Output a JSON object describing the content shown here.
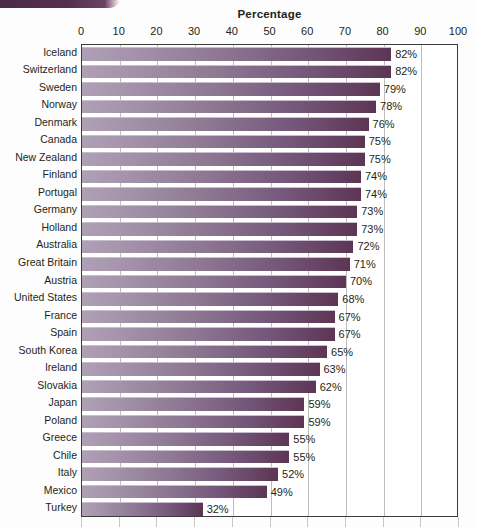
{
  "chart_data": {
    "type": "bar",
    "orientation": "horizontal",
    "title": "Percentage",
    "xlabel": "",
    "ylabel": "",
    "xlim": [
      0,
      100
    ],
    "xticks": [
      0,
      10,
      20,
      30,
      40,
      50,
      60,
      70,
      80,
      90,
      100
    ],
    "grid": true,
    "legend": "none",
    "value_suffix": "%",
    "categories": [
      "Iceland",
      "Switzerland",
      "Sweden",
      "Norway",
      "Denmark",
      "Canada",
      "New Zealand",
      "Finland",
      "Portugal",
      "Germany",
      "Holland",
      "Australia",
      "Great Britain",
      "Austria",
      "United States",
      "France",
      "Spain",
      "South Korea",
      "Ireland",
      "Slovakia",
      "Japan",
      "Poland",
      "Greece",
      "Chile",
      "Italy",
      "Mexico",
      "Turkey"
    ],
    "values": [
      82,
      82,
      79,
      78,
      76,
      75,
      75,
      74,
      74,
      73,
      73,
      72,
      71,
      70,
      68,
      67,
      67,
      65,
      63,
      62,
      59,
      59,
      55,
      55,
      52,
      49,
      32
    ],
    "data_labels": [
      "82%",
      "82%",
      "79%",
      "78%",
      "76%",
      "75%",
      "75%",
      "74%",
      "74%",
      "73%",
      "73%",
      "72%",
      "71%",
      "70%",
      "68%",
      "67%",
      "67%",
      "65%",
      "63%",
      "62%",
      "59%",
      "59%",
      "55%",
      "55%",
      "52%",
      "49%",
      "32%"
    ],
    "colors": {
      "bar_gradient_start": "#b0a0b5",
      "bar_gradient_end": "#5d3554",
      "plot_border": "#3c3c3c",
      "gridline": "#bdbdbd",
      "background": "#fdfdfd",
      "text": "#231f20",
      "decor_band": "#4a2a46"
    }
  }
}
